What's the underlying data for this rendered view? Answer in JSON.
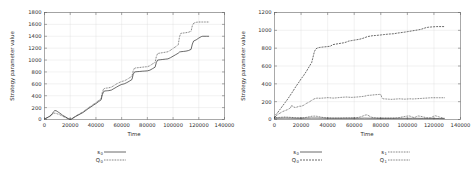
{
  "figure": {
    "panel_count": 2,
    "background_color": "#ffffff",
    "line_color": "#1a1a1a",
    "grid_color": "#d9d9d9",
    "axis_color": "#555555"
  },
  "chart_data": [
    {
      "type": "line",
      "title": "",
      "xlabel": "Time",
      "ylabel": "Strategy parameter value",
      "xlim": [
        0,
        140000
      ],
      "ylim": [
        0,
        1800
      ],
      "xticks": [
        0,
        20000,
        40000,
        60000,
        80000,
        100000,
        120000,
        140000
      ],
      "xtick_labels": [
        "0",
        "20000",
        "40000",
        "60000",
        "80000",
        "100000",
        "120000",
        "140000"
      ],
      "yticks": [
        0,
        200,
        400,
        600,
        800,
        1000,
        1200,
        1400,
        1600,
        1800
      ],
      "ytick_labels": [
        "0",
        "200",
        "400",
        "600",
        "800",
        "1000",
        "1200",
        "1400",
        "1600",
        "1800"
      ],
      "grid": true,
      "legend_position": "below",
      "legend": [
        {
          "name": "s",
          "sub": "0",
          "style": "solid"
        },
        {
          "name": "Q",
          "sub": "0",
          "style": "dotted"
        }
      ],
      "series": [
        {
          "name": "s0",
          "style": "solid",
          "x": [
            0,
            2000,
            4000,
            6000,
            7000,
            8000,
            9000,
            10000,
            11000,
            12000,
            13000,
            14000,
            16000,
            18000,
            19000,
            20000,
            21000,
            22000,
            24000,
            26000,
            28000,
            30000,
            32000,
            34000,
            36000,
            38000,
            40000,
            42000,
            44000,
            45000,
            46000,
            47000,
            48000,
            49000,
            50000,
            52000,
            54000,
            56000,
            58000,
            60000,
            62000,
            64000,
            66000,
            68000,
            69000,
            70000,
            72000,
            74000,
            76000,
            78000,
            80000,
            82000,
            84000,
            86000,
            87000,
            88000,
            90000,
            92000,
            94000,
            96000,
            98000,
            100000,
            102000,
            104000,
            105000,
            106000,
            108000,
            110000,
            112000,
            114000,
            115000,
            116000,
            118000,
            120000,
            122000,
            123000,
            124000,
            126000,
            128000
          ],
          "y": [
            10,
            30,
            55,
            95,
            130,
            150,
            148,
            135,
            120,
            105,
            90,
            72,
            48,
            22,
            10,
            5,
            8,
            20,
            48,
            72,
            95,
            118,
            150,
            182,
            210,
            240,
            268,
            300,
            330,
            420,
            470,
            480,
            482,
            484,
            486,
            495,
            520,
            545,
            570,
            590,
            600,
            620,
            645,
            672,
            760,
            800,
            805,
            808,
            812,
            815,
            818,
            830,
            855,
            880,
            960,
            1000,
            1005,
            1010,
            1015,
            1020,
            1040,
            1065,
            1090,
            1115,
            1135,
            1140,
            1145,
            1150,
            1160,
            1180,
            1270,
            1320,
            1340,
            1370,
            1395,
            1400,
            1400,
            1400,
            1400
          ]
        },
        {
          "name": "Q0",
          "style": "dotted",
          "x": [
            0,
            2000,
            4000,
            6000,
            7000,
            8000,
            9000,
            10000,
            11000,
            12000,
            13000,
            14000,
            16000,
            18000,
            19000,
            20000,
            21000,
            22000,
            24000,
            26000,
            28000,
            30000,
            32000,
            34000,
            36000,
            38000,
            40000,
            42000,
            44000,
            45000,
            46000,
            47000,
            48000,
            49000,
            50000,
            52000,
            54000,
            56000,
            58000,
            60000,
            62000,
            64000,
            66000,
            68000,
            69000,
            70000,
            72000,
            74000,
            76000,
            78000,
            80000,
            82000,
            84000,
            86000,
            87000,
            88000,
            90000,
            92000,
            94000,
            96000,
            98000,
            100000,
            102000,
            104000,
            105000,
            106000,
            108000,
            110000,
            112000,
            114000,
            115000,
            116000,
            118000,
            120000,
            122000,
            123000,
            124000,
            126000,
            128000
          ],
          "y": [
            10,
            28,
            50,
            80,
            100,
            108,
            102,
            95,
            88,
            78,
            68,
            55,
            36,
            16,
            7,
            4,
            10,
            25,
            55,
            80,
            105,
            130,
            162,
            195,
            225,
            255,
            285,
            318,
            350,
            460,
            515,
            525,
            528,
            530,
            533,
            545,
            570,
            598,
            620,
            640,
            650,
            672,
            700,
            728,
            820,
            865,
            870,
            875,
            880,
            885,
            888,
            905,
            935,
            960,
            1060,
            1110,
            1118,
            1125,
            1132,
            1140,
            1165,
            1195,
            1225,
            1255,
            1390,
            1450,
            1455,
            1460,
            1468,
            1485,
            1580,
            1620,
            1635,
            1640,
            1640,
            1640,
            1640,
            1640,
            1640
          ]
        }
      ]
    },
    {
      "type": "line",
      "title": "",
      "xlabel": "Time",
      "ylabel": "Strategy parameter value",
      "xlim": [
        0,
        140000
      ],
      "ylim": [
        0,
        1200
      ],
      "xticks": [
        0,
        20000,
        40000,
        60000,
        80000,
        100000,
        120000,
        140000
      ],
      "xtick_labels": [
        "0",
        "20000",
        "40000",
        "60000",
        "80000",
        "100000",
        "120000",
        "140000"
      ],
      "yticks": [
        0,
        200,
        400,
        600,
        800,
        1000,
        1200
      ],
      "ytick_labels": [
        "0",
        "200",
        "400",
        "600",
        "800",
        "1000",
        "1200"
      ],
      "grid": true,
      "legend_position": "below",
      "legend": [
        {
          "name": "s",
          "sub": "0",
          "style": "solid"
        },
        {
          "name": "s",
          "sub": "1",
          "style": "dotted"
        },
        {
          "name": "Q",
          "sub": "0",
          "style": "dashed"
        },
        {
          "name": "Q",
          "sub": "1",
          "style": "dotted"
        }
      ],
      "series": [
        {
          "name": "Q0",
          "style": "dashed",
          "x": [
            0,
            1000,
            2000,
            4000,
            6000,
            8000,
            10000,
            12000,
            14000,
            16000,
            18000,
            20000,
            22000,
            24000,
            26000,
            28000,
            29000,
            30000,
            31000,
            32000,
            33000,
            34000,
            36000,
            38000,
            40000,
            42000,
            44000,
            46000,
            48000,
            50000,
            52000,
            54000,
            56000,
            58000,
            60000,
            62000,
            64000,
            66000,
            68000,
            70000,
            72000,
            74000,
            76000,
            78000,
            80000,
            82000,
            84000,
            86000,
            88000,
            90000,
            92000,
            94000,
            96000,
            98000,
            100000,
            102000,
            104000,
            106000,
            108000,
            110000,
            112000,
            114000,
            116000,
            118000,
            120000,
            122000,
            124000,
            126000,
            128000
          ],
          "y": [
            20,
            55,
            70,
            110,
            150,
            190,
            230,
            275,
            320,
            368,
            410,
            455,
            495,
            540,
            590,
            640,
            700,
            760,
            790,
            800,
            805,
            808,
            812,
            815,
            818,
            822,
            840,
            845,
            850,
            855,
            860,
            868,
            880,
            885,
            890,
            895,
            900,
            908,
            918,
            930,
            935,
            940,
            942,
            945,
            948,
            952,
            955,
            958,
            960,
            962,
            968,
            972,
            976,
            980,
            985,
            990,
            995,
            1000,
            1005,
            1010,
            1020,
            1030,
            1035,
            1038,
            1040,
            1042,
            1042,
            1042,
            1042
          ]
        },
        {
          "name": "Q1",
          "style": "dotted",
          "x": [
            0,
            1000,
            2000,
            4000,
            6000,
            8000,
            10000,
            12000,
            13000,
            14000,
            16000,
            18000,
            19000,
            20000,
            22000,
            24000,
            26000,
            28000,
            30000,
            32000,
            34000,
            36000,
            38000,
            40000,
            42000,
            44000,
            46000,
            48000,
            50000,
            52000,
            54000,
            56000,
            58000,
            60000,
            62000,
            64000,
            66000,
            68000,
            70000,
            72000,
            74000,
            76000,
            78000,
            79000,
            80000,
            81000,
            82000,
            84000,
            86000,
            88000,
            90000,
            92000,
            94000,
            96000,
            98000,
            100000,
            102000,
            104000,
            106000,
            108000,
            110000,
            112000,
            114000,
            116000,
            118000,
            120000,
            122000,
            124000,
            126000,
            128000
          ],
          "y": [
            15,
            40,
            50,
            70,
            88,
            100,
            112,
            130,
            160,
            140,
            135,
            145,
            150,
            148,
            160,
            180,
            195,
            215,
            232,
            240,
            238,
            240,
            242,
            245,
            243,
            240,
            242,
            245,
            248,
            250,
            252,
            250,
            248,
            250,
            252,
            255,
            258,
            262,
            270,
            272,
            275,
            278,
            280,
            282,
            280,
            238,
            232,
            230,
            228,
            226,
            228,
            230,
            232,
            230,
            228,
            230,
            232,
            230,
            232,
            234,
            236,
            238,
            240,
            242,
            244,
            244,
            244,
            244,
            244,
            244
          ]
        },
        {
          "name": "s1",
          "style": "dotted",
          "x": [
            0,
            2000,
            4000,
            6000,
            8000,
            10000,
            12000,
            14000,
            16000,
            18000,
            20000,
            22000,
            24000,
            26000,
            28000,
            30000,
            32000,
            34000,
            36000,
            38000,
            40000,
            42000,
            44000,
            46000,
            48000,
            50000,
            52000,
            54000,
            56000,
            58000,
            60000,
            62000,
            64000,
            66000,
            68000,
            69000,
            70000,
            71000,
            72000,
            74000,
            76000,
            78000,
            80000,
            82000,
            84000,
            86000,
            88000,
            90000,
            92000,
            94000,
            96000,
            98000,
            100000,
            101000,
            102000,
            103000,
            104000,
            105000,
            106000,
            107000,
            108000,
            110000,
            112000,
            114000,
            116000,
            118000,
            119000,
            120000,
            121000,
            122000,
            124000,
            126000,
            128000
          ],
          "y": [
            18,
            22,
            24,
            26,
            28,
            26,
            24,
            22,
            20,
            19,
            18,
            20,
            24,
            30,
            36,
            38,
            36,
            30,
            24,
            20,
            18,
            17,
            16,
            16,
            16,
            16,
            17,
            18,
            18,
            18,
            18,
            20,
            26,
            36,
            48,
            52,
            50,
            42,
            32,
            22,
            18,
            16,
            16,
            16,
            16,
            16,
            16,
            16,
            18,
            22,
            28,
            34,
            38,
            40,
            38,
            32,
            26,
            22,
            26,
            34,
            40,
            36,
            28,
            22,
            18,
            22,
            30,
            38,
            42,
            38,
            28,
            20,
            14
          ]
        },
        {
          "name": "s0",
          "style": "solid",
          "x": [
            0,
            4000,
            8000,
            12000,
            16000,
            20000,
            24000,
            28000,
            32000,
            36000,
            40000,
            44000,
            48000,
            52000,
            56000,
            60000,
            64000,
            68000,
            72000,
            76000,
            80000,
            84000,
            88000,
            92000,
            96000,
            100000,
            104000,
            108000,
            112000,
            116000,
            120000,
            124000,
            128000
          ],
          "y": [
            14,
            15,
            16,
            15,
            14,
            14,
            15,
            16,
            16,
            15,
            14,
            14,
            14,
            14,
            14,
            14,
            14,
            15,
            14,
            14,
            13,
            13,
            13,
            13,
            13,
            13,
            13,
            13,
            12,
            12,
            12,
            11,
            10
          ]
        }
      ]
    }
  ]
}
